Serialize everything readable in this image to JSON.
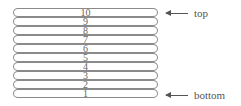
{
  "diagram": {
    "type": "stack",
    "items": [
      "10",
      "9",
      "8",
      "7",
      "6",
      "5",
      "4",
      "3",
      "2",
      "1"
    ],
    "top_label": "top",
    "bottom_label": "bottom",
    "colors": {
      "outline": "#8a8a8a",
      "text": "#666666",
      "background": "#ffffff"
    }
  }
}
